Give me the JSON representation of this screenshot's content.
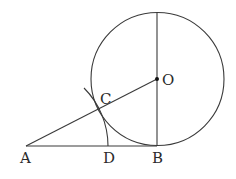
{
  "diagram": {
    "type": "geometry",
    "points": {
      "A": {
        "label": "A",
        "x": 26,
        "y": 146
      },
      "B": {
        "label": "B",
        "x": 157,
        "y": 146
      },
      "C": {
        "label": "C",
        "x": 99,
        "y": 109
      },
      "D": {
        "label": "D",
        "x": 108,
        "y": 146
      },
      "O": {
        "label": "O",
        "x": 157,
        "y": 79
      }
    },
    "circle": {
      "center": "O",
      "radius": 67
    },
    "segments": [
      "AB",
      "AO",
      "OB (vertical diameter through O)"
    ],
    "arc": {
      "center": "A",
      "through": [
        "C",
        "D"
      ]
    },
    "colors": {
      "line": "#3a3a3a",
      "text": "#2b2b2b",
      "background": "#ffffff"
    }
  }
}
